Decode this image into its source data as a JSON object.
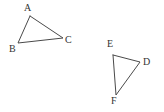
{
  "figure": {
    "background_color": "#ffffff",
    "stroke_color": "#4a4a4a",
    "label_color": "#333333",
    "width": 164,
    "height": 112,
    "shapes": [
      {
        "name": "triangle-abc",
        "kind": "triangle",
        "vertices": [
          {
            "label": "A",
            "x": 30,
            "y": 16,
            "label_x": 24,
            "label_y": 3
          },
          {
            "label": "B",
            "x": 18,
            "y": 43,
            "label_x": 9,
            "label_y": 44
          },
          {
            "label": "C",
            "x": 63,
            "y": 38,
            "label_x": 65,
            "label_y": 35
          }
        ],
        "points_attr": "30,16 18,43 63,38 30,16"
      },
      {
        "name": "triangle-def",
        "kind": "triangle",
        "vertices": [
          {
            "label": "E",
            "x": 113,
            "y": 55,
            "label_x": 107,
            "label_y": 39
          },
          {
            "label": "D",
            "x": 140,
            "y": 62,
            "label_x": 143,
            "label_y": 57
          },
          {
            "label": "F",
            "x": 116,
            "y": 95,
            "label_x": 111,
            "label_y": 96
          }
        ],
        "points_attr": "113,55 140,62 116,95 113,55"
      }
    ]
  }
}
